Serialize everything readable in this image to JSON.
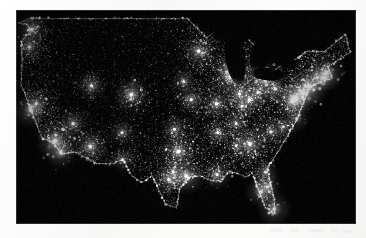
{
  "page": {
    "background_color": "#fbfbfa",
    "kind": "scanned-photograph-page"
  },
  "photo": {
    "title": "Nighttime satellite image of the United States city lights",
    "alt_text": "Composite satellite view of the continental United States at night showing urban light clusters",
    "background_color": "#050507",
    "light_color": "#ffffff",
    "frame": {
      "left": 16,
      "top": 10,
      "width": 340,
      "height": 214
    }
  },
  "artifacts": {
    "label": "faint scanner smudges below photograph",
    "marks": [
      {
        "x": 2,
        "y": 2,
        "w": 13,
        "h": 4,
        "opacity": 0.26
      },
      {
        "x": 22,
        "y": 1,
        "w": 9,
        "h": 5,
        "opacity": 0.22
      },
      {
        "x": 40,
        "y": 3,
        "w": 16,
        "h": 3,
        "opacity": 0.3
      },
      {
        "x": 62,
        "y": 2,
        "w": 7,
        "h": 4,
        "opacity": 0.2
      },
      {
        "x": 74,
        "y": 4,
        "w": 12,
        "h": 3,
        "opacity": 0.24
      }
    ]
  },
  "chart_data": {
    "type": "heatmap",
    "title": "United States City Lights at Night",
    "subtitle": "Satellite composite of artificial light emission",
    "xlabel": "Longitude (west to east)",
    "ylabel": "Latitude (north to south)",
    "grid": false,
    "legend_position": "none",
    "xlim": [
      -125,
      -66
    ],
    "ylim": [
      24,
      50
    ],
    "value_label": "Relative light intensity (0 = dark, 1 = brightest)",
    "notes": [
      "Eastern half of the country is densely lit; western interior is sparse.",
      "Great Lakes and Gulf of Mexico appear as unlit dark voids.",
      "Brightest continuous band is the Northeast corridor from Washington DC to Boston."
    ],
    "regions": [
      {
        "name": "Northeast Megalopolis",
        "x": -74.5,
        "y": 40.3,
        "intensity": 1.0
      },
      {
        "name": "Great Lakes / Midwest",
        "x": -86.0,
        "y": 42.0,
        "intensity": 0.72
      },
      {
        "name": "Southeast",
        "x": -82.0,
        "y": 33.0,
        "intensity": 0.58
      },
      {
        "name": "Gulf Coast / Texas Triangle",
        "x": -96.0,
        "y": 30.5,
        "intensity": 0.62
      },
      {
        "name": "Great Plains",
        "x": -100.0,
        "y": 40.0,
        "intensity": 0.22
      },
      {
        "name": "Rocky Mountains",
        "x": -108.0,
        "y": 40.0,
        "intensity": 0.12
      },
      {
        "name": "Great Basin / Desert Southwest",
        "x": -115.0,
        "y": 38.0,
        "intensity": 0.09
      },
      {
        "name": "Pacific Coast",
        "x": -120.0,
        "y": 37.5,
        "intensity": 0.7
      }
    ],
    "cities": [
      {
        "name": "New York City",
        "x": -74.0,
        "y": 40.7,
        "intensity": 1.0
      },
      {
        "name": "Philadelphia",
        "x": -75.2,
        "y": 39.9,
        "intensity": 0.88
      },
      {
        "name": "Washington DC",
        "x": -77.0,
        "y": 38.9,
        "intensity": 0.86
      },
      {
        "name": "Baltimore",
        "x": -76.6,
        "y": 39.3,
        "intensity": 0.8
      },
      {
        "name": "Boston",
        "x": -71.1,
        "y": 42.4,
        "intensity": 0.9
      },
      {
        "name": "Providence",
        "x": -71.4,
        "y": 41.8,
        "intensity": 0.66
      },
      {
        "name": "Hartford",
        "x": -72.7,
        "y": 41.8,
        "intensity": 0.62
      },
      {
        "name": "Pittsburgh",
        "x": -80.0,
        "y": 40.4,
        "intensity": 0.7
      },
      {
        "name": "Cleveland",
        "x": -81.7,
        "y": 41.5,
        "intensity": 0.74
      },
      {
        "name": "Columbus",
        "x": -83.0,
        "y": 40.0,
        "intensity": 0.66
      },
      {
        "name": "Detroit",
        "x": -83.0,
        "y": 42.3,
        "intensity": 0.84
      },
      {
        "name": "Chicago",
        "x": -87.6,
        "y": 41.9,
        "intensity": 0.96
      },
      {
        "name": "Milwaukee",
        "x": -87.9,
        "y": 43.0,
        "intensity": 0.66
      },
      {
        "name": "Indianapolis",
        "x": -86.2,
        "y": 39.8,
        "intensity": 0.68
      },
      {
        "name": "Cincinnati",
        "x": -84.5,
        "y": 39.1,
        "intensity": 0.66
      },
      {
        "name": "Louisville",
        "x": -85.8,
        "y": 38.3,
        "intensity": 0.58
      },
      {
        "name": "St. Louis",
        "x": -90.2,
        "y": 38.6,
        "intensity": 0.74
      },
      {
        "name": "Kansas City",
        "x": -94.6,
        "y": 39.1,
        "intensity": 0.66
      },
      {
        "name": "Minneapolis",
        "x": -93.3,
        "y": 45.0,
        "intensity": 0.76
      },
      {
        "name": "Omaha",
        "x": -95.9,
        "y": 41.3,
        "intensity": 0.56
      },
      {
        "name": "Denver",
        "x": -105.0,
        "y": 39.7,
        "intensity": 0.8
      },
      {
        "name": "Salt Lake City",
        "x": -111.9,
        "y": 40.8,
        "intensity": 0.66
      },
      {
        "name": "Las Vegas",
        "x": -115.1,
        "y": 36.2,
        "intensity": 0.7
      },
      {
        "name": "Phoenix",
        "x": -112.1,
        "y": 33.4,
        "intensity": 0.84
      },
      {
        "name": "Albuquerque",
        "x": -106.6,
        "y": 35.1,
        "intensity": 0.56
      },
      {
        "name": "El Paso",
        "x": -106.5,
        "y": 31.8,
        "intensity": 0.58
      },
      {
        "name": "San Diego",
        "x": -117.2,
        "y": 32.7,
        "intensity": 0.8
      },
      {
        "name": "Los Angeles",
        "x": -118.2,
        "y": 34.1,
        "intensity": 1.0
      },
      {
        "name": "San Francisco",
        "x": -122.4,
        "y": 37.8,
        "intensity": 0.88
      },
      {
        "name": "Sacramento",
        "x": -121.5,
        "y": 38.6,
        "intensity": 0.62
      },
      {
        "name": "Portland",
        "x": -122.7,
        "y": 45.5,
        "intensity": 0.7
      },
      {
        "name": "Seattle",
        "x": -122.3,
        "y": 47.6,
        "intensity": 0.78
      },
      {
        "name": "Dallas",
        "x": -96.8,
        "y": 32.8,
        "intensity": 0.88
      },
      {
        "name": "Houston",
        "x": -95.4,
        "y": 29.8,
        "intensity": 0.88
      },
      {
        "name": "San Antonio",
        "x": -98.5,
        "y": 29.4,
        "intensity": 0.7
      },
      {
        "name": "Austin",
        "x": -97.7,
        "y": 30.3,
        "intensity": 0.6
      },
      {
        "name": "Oklahoma City",
        "x": -97.5,
        "y": 35.5,
        "intensity": 0.62
      },
      {
        "name": "New Orleans",
        "x": -90.1,
        "y": 30.0,
        "intensity": 0.72
      },
      {
        "name": "Memphis",
        "x": -90.0,
        "y": 35.1,
        "intensity": 0.62
      },
      {
        "name": "Nashville",
        "x": -86.8,
        "y": 36.2,
        "intensity": 0.62
      },
      {
        "name": "Atlanta",
        "x": -84.4,
        "y": 33.7,
        "intensity": 0.86
      },
      {
        "name": "Birmingham",
        "x": -86.8,
        "y": 33.5,
        "intensity": 0.56
      },
      {
        "name": "Charlotte",
        "x": -80.8,
        "y": 35.2,
        "intensity": 0.64
      },
      {
        "name": "Raleigh",
        "x": -78.6,
        "y": 35.8,
        "intensity": 0.58
      },
      {
        "name": "Norfolk",
        "x": -76.3,
        "y": 36.8,
        "intensity": 0.62
      },
      {
        "name": "Jacksonville",
        "x": -81.7,
        "y": 30.3,
        "intensity": 0.64
      },
      {
        "name": "Orlando",
        "x": -81.4,
        "y": 28.5,
        "intensity": 0.7
      },
      {
        "name": "Tampa",
        "x": -82.5,
        "y": 27.9,
        "intensity": 0.76
      },
      {
        "name": "Miami",
        "x": -80.2,
        "y": 25.8,
        "intensity": 0.86
      }
    ],
    "dark_zones": [
      {
        "name": "Lake Michigan",
        "x": -87.0,
        "y": 44.0
      },
      {
        "name": "Lake Superior",
        "x": -88.0,
        "y": 47.5
      },
      {
        "name": "Lake Huron",
        "x": -82.5,
        "y": 44.8
      },
      {
        "name": "Lake Erie",
        "x": -81.2,
        "y": 42.2
      },
      {
        "name": "Lake Ontario",
        "x": -77.8,
        "y": 43.7
      },
      {
        "name": "Gulf of Mexico",
        "x": -90.0,
        "y": 26.0
      },
      {
        "name": "Atlantic Ocean",
        "x": -70.0,
        "y": 33.0
      },
      {
        "name": "Pacific Ocean",
        "x": -126.0,
        "y": 38.0
      }
    ]
  }
}
